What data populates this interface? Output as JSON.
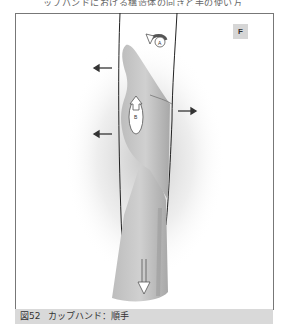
{
  "header": {
    "cut_text": "ップハンドにおける構造体の向きと手の使い方"
  },
  "figure": {
    "panel_label": "F",
    "labels": {
      "a": "A",
      "b": "B"
    },
    "caption_number": "図52",
    "caption_text": "カップハンド：順手"
  },
  "colors": {
    "caption_bg": "#d9d9d9",
    "badge_bg": "#d6d6d6",
    "skin": "#c8c8c8",
    "skin_dark": "#a9a9a9",
    "arrow": "#444444"
  }
}
